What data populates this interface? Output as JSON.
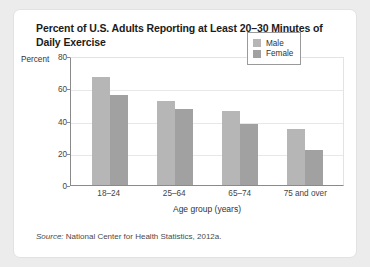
{
  "title": "Percent of U.S. Adults Reporting at Least 20–30 Minutes of Daily Exercise",
  "axis_unit_label": "Percent",
  "source": {
    "prefix": "Source:",
    "text": "National Center for Health Statistics, 2012a."
  },
  "legend": {
    "male_label": "Male",
    "female_label": "Female"
  },
  "colors": {
    "male": "#b6b6b6",
    "female": "#a1a1a1",
    "card_background": "#ffffff",
    "page_background": "#ececed",
    "axis": "#8a8a8a",
    "gridline": "#e8e8e8"
  },
  "chart_data": {
    "type": "bar",
    "title": "Percent of U.S. Adults Reporting at Least 20–30 Minutes of Daily Exercise",
    "xlabel": "Age group (years)",
    "ylabel": "Percent",
    "categories": [
      "18–24",
      "25–64",
      "65–74",
      "75 and over"
    ],
    "series": [
      {
        "name": "Male",
        "values": [
          67,
          52,
          46,
          35
        ]
      },
      {
        "name": "Female",
        "values": [
          56,
          47,
          38,
          22
        ]
      }
    ],
    "ylim": [
      0,
      80
    ],
    "yticks": [
      0,
      20,
      40,
      60,
      80
    ],
    "grid": true,
    "legend_position": "top-right"
  }
}
